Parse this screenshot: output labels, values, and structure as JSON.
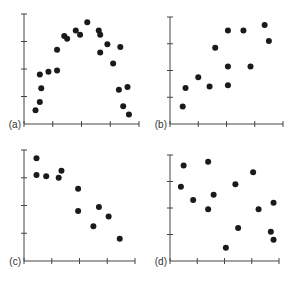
{
  "figure": {
    "axis_color": "#444444",
    "point_color": "#1a1a1a"
  },
  "chart_data": [
    {
      "type": "scatter",
      "panel_label": "(a)",
      "title": "",
      "xlabel": "",
      "ylabel": "",
      "xlim": [
        0,
        4
      ],
      "ylim": [
        0,
        4
      ],
      "grid": false,
      "x_ticks": [
        0,
        1,
        2,
        3,
        4
      ],
      "y_ticks": [
        1,
        2,
        3,
        4
      ],
      "points": [
        [
          0.4,
          0.5
        ],
        [
          0.55,
          0.8
        ],
        [
          0.55,
          1.8
        ],
        [
          0.6,
          1.3
        ],
        [
          0.85,
          1.9
        ],
        [
          1.15,
          2.7
        ],
        [
          1.15,
          1.95
        ],
        [
          1.4,
          3.2
        ],
        [
          1.5,
          3.1
        ],
        [
          1.8,
          3.4
        ],
        [
          1.95,
          3.25
        ],
        [
          2.2,
          3.7
        ],
        [
          2.6,
          3.4
        ],
        [
          2.65,
          3.25
        ],
        [
          2.65,
          2.6
        ],
        [
          2.9,
          2.9
        ],
        [
          3.1,
          2.2
        ],
        [
          3.3,
          1.25
        ],
        [
          3.35,
          2.8
        ],
        [
          3.45,
          0.65
        ],
        [
          3.6,
          1.35
        ],
        [
          3.65,
          0.35
        ]
      ]
    },
    {
      "type": "scatter",
      "panel_label": "(b)",
      "title": "",
      "xlabel": "",
      "ylabel": "",
      "xlim": [
        0,
        4
      ],
      "ylim": [
        0,
        4
      ],
      "grid": false,
      "x_ticks": [
        0,
        1,
        2,
        3,
        4
      ],
      "y_ticks": [
        1,
        2,
        3,
        4
      ],
      "points": [
        [
          0.45,
          0.65
        ],
        [
          0.55,
          1.35
        ],
        [
          1.0,
          1.75
        ],
        [
          1.4,
          1.4
        ],
        [
          1.6,
          2.85
        ],
        [
          2.05,
          1.45
        ],
        [
          2.05,
          2.15
        ],
        [
          2.05,
          3.5
        ],
        [
          2.6,
          3.5
        ],
        [
          2.85,
          2.15
        ],
        [
          3.35,
          3.7
        ],
        [
          3.5,
          3.1
        ]
      ]
    },
    {
      "type": "scatter",
      "panel_label": "(c)",
      "title": "",
      "xlabel": "",
      "ylabel": "",
      "xlim": [
        0,
        4
      ],
      "ylim": [
        0,
        4
      ],
      "grid": false,
      "x_ticks": [
        0,
        1,
        2,
        3,
        4
      ],
      "y_ticks": [
        1,
        2,
        3,
        4
      ],
      "points": [
        [
          0.45,
          3.7
        ],
        [
          0.45,
          3.1
        ],
        [
          0.8,
          3.05
        ],
        [
          1.25,
          3.0
        ],
        [
          1.35,
          3.25
        ],
        [
          1.95,
          2.6
        ],
        [
          1.95,
          1.8
        ],
        [
          2.5,
          1.25
        ],
        [
          2.7,
          1.95
        ],
        [
          3.05,
          1.6
        ],
        [
          3.45,
          0.8
        ]
      ]
    },
    {
      "type": "scatter",
      "panel_label": "(d)",
      "title": "",
      "xlabel": "",
      "ylabel": "",
      "xlim": [
        0,
        4
      ],
      "ylim": [
        0,
        4
      ],
      "grid": false,
      "x_ticks": [
        0,
        1,
        2,
        3,
        4
      ],
      "y_ticks": [
        1,
        2,
        3,
        4
      ],
      "points": [
        [
          0.5,
          3.6
        ],
        [
          0.4,
          2.8
        ],
        [
          0.85,
          2.3
        ],
        [
          1.4,
          3.75
        ],
        [
          1.4,
          1.95
        ],
        [
          1.6,
          2.5
        ],
        [
          2.05,
          0.5
        ],
        [
          2.4,
          2.9
        ],
        [
          2.5,
          1.25
        ],
        [
          3.05,
          3.35
        ],
        [
          3.25,
          1.95
        ],
        [
          3.7,
          1.1
        ],
        [
          3.8,
          2.2
        ],
        [
          3.8,
          0.8
        ]
      ]
    }
  ]
}
